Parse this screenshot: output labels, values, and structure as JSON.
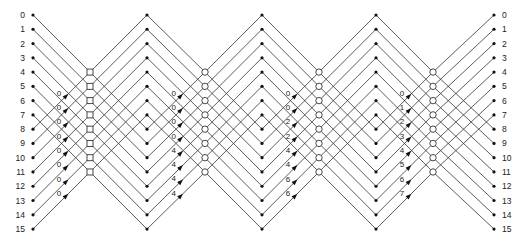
{
  "diagram": {
    "type": "fft-signal-flow-graph",
    "points": 16,
    "stages": 4,
    "input_labels": [
      "0",
      "1",
      "2",
      "3",
      "4",
      "5",
      "6",
      "7",
      "8",
      "9",
      "10",
      "11",
      "12",
      "13",
      "14",
      "15"
    ],
    "output_labels": [
      "0",
      "1",
      "2",
      "3",
      "4",
      "5",
      "6",
      "7",
      "8",
      "9",
      "10",
      "11",
      "12",
      "13",
      "14",
      "15"
    ],
    "stage_twiddles": [
      [
        "0",
        "0",
        "0",
        "0",
        "0",
        "0",
        "0",
        "0"
      ],
      [
        "0",
        "0",
        "0",
        "0",
        "4",
        "4",
        "4",
        "4"
      ],
      [
        "0",
        "0",
        "2",
        "2",
        "4",
        "4",
        "6",
        "6"
      ],
      [
        "0",
        "1",
        "2",
        "3",
        "4",
        "5",
        "6",
        "7"
      ]
    ],
    "junction_markers": [
      "square",
      "circle",
      "circle",
      "circle"
    ],
    "colors": {
      "line": "#333333",
      "node": "#111111",
      "background": "#ffffff"
    }
  }
}
